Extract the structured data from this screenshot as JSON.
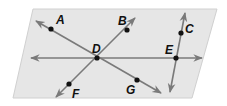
{
  "diagram": {
    "colors": {
      "plane_fill": "#e6e6e6",
      "plane_stroke": "#d0d0d0",
      "line": "#7a7a7a",
      "point": "#111111",
      "label": "#111111"
    },
    "plane": {
      "points": "33,9 217,9 192,98 13,98"
    },
    "lines": [
      {
        "id": "line-AG",
        "x1": 36,
        "y1": 21,
        "x2": 161,
        "y2": 93,
        "arrows": "both"
      },
      {
        "id": "line-BF",
        "x1": 135,
        "y1": 18,
        "x2": 56,
        "y2": 97,
        "arrows": "both"
      },
      {
        "id": "line-horizontal-DE",
        "x1": 31,
        "y1": 58,
        "x2": 202,
        "y2": 58,
        "arrows": "both"
      },
      {
        "id": "line-CE",
        "x1": 185,
        "y1": 13,
        "x2": 170,
        "y2": 92,
        "arrows": "both"
      }
    ],
    "points": [
      {
        "label": "A",
        "x": 51,
        "y": 29,
        "lx": 56,
        "ly": 24
      },
      {
        "label": "B",
        "x": 127,
        "y": 30,
        "lx": 118,
        "ly": 25
      },
      {
        "label": "C",
        "x": 181,
        "y": 33,
        "lx": 185,
        "ly": 33
      },
      {
        "label": "D",
        "x": 97,
        "y": 58,
        "lx": 92,
        "ly": 53
      },
      {
        "label": "E",
        "x": 176,
        "y": 58,
        "lx": 165,
        "ly": 54
      },
      {
        "label": "F",
        "x": 69,
        "y": 84,
        "lx": 72,
        "ly": 98
      },
      {
        "label": "G",
        "x": 137,
        "y": 80,
        "lx": 126,
        "ly": 94
      }
    ]
  }
}
